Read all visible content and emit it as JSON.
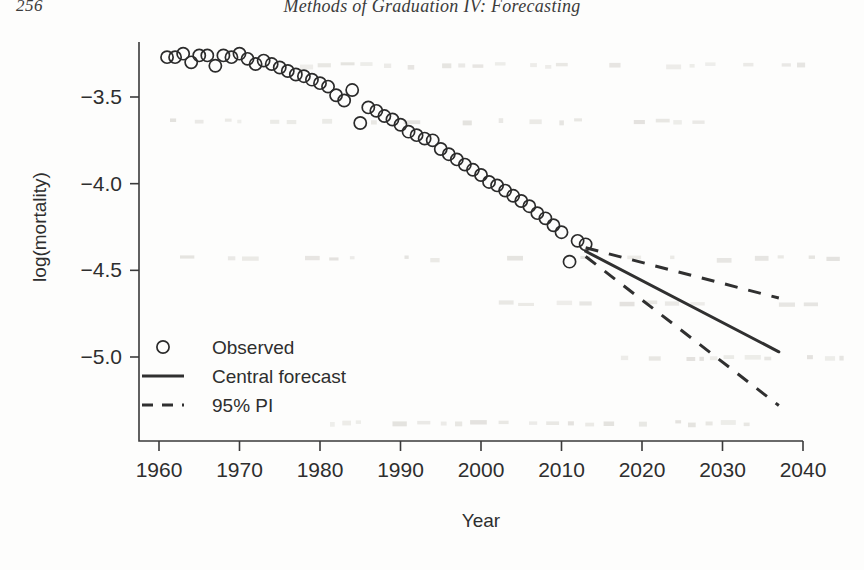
{
  "page": {
    "number": "256",
    "running_head": "Methods of Graduation IV: Forecasting"
  },
  "chart_data": {
    "type": "scatter",
    "title": "",
    "xlabel": "Year",
    "ylabel": "log(mortality)",
    "xlim": [
      1958,
      2042
    ],
    "ylim": [
      -5.35,
      -3.15
    ],
    "xticks": [
      1960,
      1970,
      1980,
      1990,
      2000,
      2010,
      2020,
      2030,
      2040
    ],
    "xtick_labels": [
      "1960",
      "1970",
      "1980",
      "1990",
      "2000",
      "2010",
      "2020",
      "2030",
      "2040"
    ],
    "yticks": [
      -3.5,
      -4.0,
      -4.5,
      -5.0
    ],
    "ytick_labels": [
      "−3.5",
      "−4.0",
      "−4.5",
      "−5.0"
    ],
    "grid": false,
    "legend_position": "bottom-left",
    "legend": [
      {
        "label": "Observed",
        "marker": "circle",
        "style": "none"
      },
      {
        "label": "Central forecast",
        "marker": "none",
        "style": "solid"
      },
      {
        "label": "95% PI",
        "marker": "none",
        "style": "dashed"
      }
    ],
    "series": [
      {
        "name": "Observed",
        "type": "scatter",
        "marker": "circle",
        "x": [
          1961,
          1962,
          1963,
          1964,
          1965,
          1966,
          1967,
          1968,
          1969,
          1970,
          1971,
          1972,
          1973,
          1974,
          1975,
          1976,
          1977,
          1978,
          1979,
          1980,
          1981,
          1982,
          1983,
          1984,
          1985,
          1986,
          1987,
          1988,
          1989,
          1990,
          1991,
          1992,
          1993,
          1994,
          1995,
          1996,
          1997,
          1998,
          1999,
          2000,
          2001,
          2002,
          2003,
          2004,
          2005,
          2006,
          2007,
          2008,
          2009,
          2010,
          2011,
          2012,
          2013
        ],
        "y": [
          -3.27,
          -3.27,
          -3.25,
          -3.3,
          -3.26,
          -3.26,
          -3.32,
          -3.26,
          -3.27,
          -3.25,
          -3.28,
          -3.31,
          -3.29,
          -3.31,
          -3.33,
          -3.35,
          -3.37,
          -3.38,
          -3.4,
          -3.42,
          -3.44,
          -3.49,
          -3.52,
          -3.46,
          -3.65,
          -3.56,
          -3.58,
          -3.61,
          -3.63,
          -3.66,
          -3.7,
          -3.72,
          -3.74,
          -3.75,
          -3.8,
          -3.83,
          -3.86,
          -3.89,
          -3.92,
          -3.95,
          -3.99,
          -4.01,
          -4.04,
          -4.07,
          -4.1,
          -4.13,
          -4.17,
          -4.2,
          -4.24,
          -4.28,
          -4.45,
          -4.33,
          -4.35
        ]
      },
      {
        "name": "Central forecast",
        "type": "line",
        "style": "solid",
        "x": [
          2013,
          2037
        ],
        "y": [
          -4.39,
          -4.97
        ]
      },
      {
        "name": "95% PI upper",
        "type": "line",
        "style": "dashed",
        "x": [
          2013,
          2037
        ],
        "y": [
          -4.37,
          -4.66
        ]
      },
      {
        "name": "95% PI lower",
        "type": "line",
        "style": "dashed",
        "x": [
          2013,
          2037
        ],
        "y": [
          -4.42,
          -5.28
        ]
      }
    ]
  }
}
